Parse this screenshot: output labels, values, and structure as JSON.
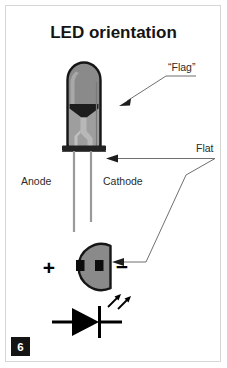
{
  "figure": {
    "title": "LED orientation",
    "page_number": "6",
    "labels": {
      "flag": "“Flag”",
      "flat": "Flat",
      "anode": "Anode",
      "cathode": "Cathode",
      "plus": "+",
      "minus": "−"
    },
    "colors": {
      "background": "#ffffff",
      "frame_border": "#d6d6d6",
      "led_body": "#8a8a8a",
      "led_body_light": "#b5b5b5",
      "led_outline": "#161616",
      "led_flag_dark": "#1d1d1d",
      "led_post": "#a9a9a9",
      "lead_gray": "#9a9a9a",
      "flange": "#232323",
      "bottom_circle": "#8a8a8a",
      "contact_black": "#0d0d0d",
      "leader_line": "#6f6f6f",
      "symbol_black": "#000000",
      "page_badge": "#141414",
      "text": "#2b2b2b",
      "title_text": "#141414"
    },
    "parts": [
      "led-body",
      "led-flag",
      "led-post",
      "led-flange",
      "anode-lead",
      "cathode-lead",
      "bottom-view-circle",
      "bottom-view-contacts",
      "schematic-symbol"
    ]
  }
}
